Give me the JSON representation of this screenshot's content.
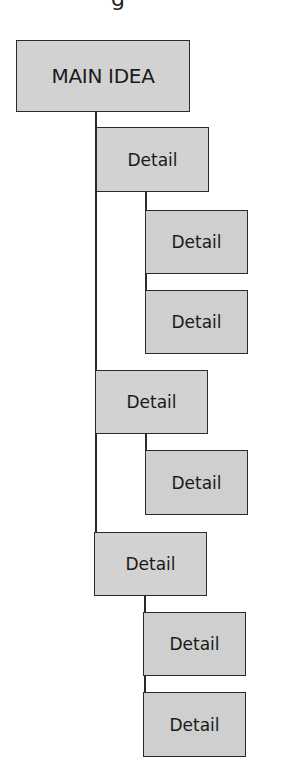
{
  "diagram": {
    "type": "hierarchical-outline",
    "header_fragment": "g",
    "colors": {
      "box_fill": "#d2d2d2",
      "border": "#2a2a2a",
      "text": "#1a1a1a"
    },
    "root": {
      "label": "MAIN IDEA"
    },
    "details": [
      {
        "label": "Detail",
        "children": [
          {
            "label": "Detail"
          },
          {
            "label": "Detail"
          }
        ]
      },
      {
        "label": "Detail",
        "children": [
          {
            "label": "Detail"
          }
        ]
      },
      {
        "label": "Detail",
        "children": [
          {
            "label": "Detail"
          },
          {
            "label": "Detail"
          }
        ]
      }
    ]
  }
}
